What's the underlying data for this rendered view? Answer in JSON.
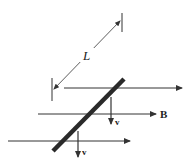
{
  "diagram": {
    "colors": {
      "line": "#333333",
      "rod": "#2a2a2a",
      "background": "#ffffff"
    },
    "labels": {
      "length": "L",
      "field": "B",
      "velocity_upper": "v",
      "velocity_lower": "v"
    },
    "field_lines": [
      {
        "x1": 64,
        "y1": 88,
        "x2": 182,
        "y2": 88
      },
      {
        "x1": 38,
        "y1": 114,
        "x2": 156,
        "y2": 114
      },
      {
        "x1": 8,
        "y1": 141,
        "x2": 130,
        "y2": 141
      }
    ],
    "rod": {
      "x1": 53,
      "y1": 151,
      "x2": 124,
      "y2": 79
    },
    "velocity_arrows": [
      {
        "x": 111,
        "y1": 97,
        "y2": 124
      },
      {
        "x": 78,
        "y1": 131,
        "y2": 156
      }
    ],
    "dimension": {
      "tick_top": {
        "x": 122,
        "y1": 13,
        "y2": 32
      },
      "tick_bottom": {
        "x": 52,
        "y1": 78,
        "y2": 101
      },
      "arrow_from": {
        "x": 55,
        "y": 89
      },
      "arrow_to": {
        "x": 120,
        "y": 21
      }
    }
  }
}
